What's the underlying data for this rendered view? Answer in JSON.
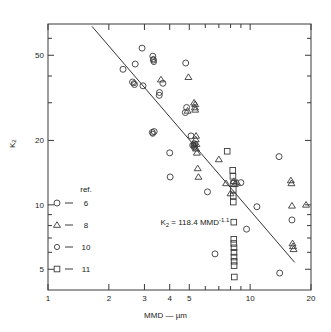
{
  "chart_data": {
    "type": "scatter",
    "title": "",
    "xlabel": "MMD — µm",
    "ylabel": "K₂",
    "xscale": "log",
    "yscale": "log",
    "xlim": [
      1,
      20
    ],
    "ylim": [
      4,
      70
    ],
    "grid": false,
    "x_ticks_labeled": [
      1,
      2,
      3,
      4,
      5,
      10,
      20
    ],
    "x_tick_labels": [
      "1",
      "2",
      "3",
      "4",
      "5",
      "10",
      "20"
    ],
    "y_ticks_labeled": [
      5,
      10,
      20,
      50
    ],
    "y_tick_labels": [
      "5",
      "10",
      "20",
      "50"
    ],
    "x_minor_ticks": [
      6,
      7,
      8,
      9
    ],
    "y_minor_ticks": [
      6,
      7,
      8,
      9,
      30,
      40,
      60
    ],
    "annotation": {
      "text": "K₂ = 118.4 MMD⁻¹·¹",
      "x": 3.6,
      "y": 8.3,
      "base": "K",
      "sub": "2",
      "eq": " = 118.4 MMD",
      "exp": "-1.1"
    },
    "fit_line": {
      "label": "K2 = 118.4 MMD^-1.1",
      "coefficient": 118.4,
      "exponent": -1.1,
      "x_start": 1.65,
      "x_end": 16.6
    },
    "legend": {
      "header": "ref.",
      "position": "lower-left",
      "entries": [
        {
          "marker": "circle",
          "size": 6.0,
          "label": "6"
        },
        {
          "marker": "triangle",
          "size": 6.0,
          "label": "8"
        },
        {
          "marker": "circle",
          "size": 5.2,
          "label": "10"
        },
        {
          "marker": "square",
          "size": 5.6,
          "label": "11"
        }
      ]
    },
    "series": [
      {
        "name": "6",
        "marker": "circle",
        "points": [
          [
            2.35,
            43.0
          ],
          [
            2.62,
            37.5
          ],
          [
            2.68,
            36.5
          ],
          [
            2.7,
            45.5
          ],
          [
            2.95,
            36.0
          ],
          [
            2.92,
            54.0
          ],
          [
            3.3,
            49.5
          ],
          [
            3.32,
            47.5
          ],
          [
            3.28,
            21.8
          ],
          [
            3.35,
            22.0
          ],
          [
            3.55,
            32.5
          ],
          [
            3.56,
            33.5
          ],
          [
            3.7,
            37.0
          ],
          [
            4.0,
            17.5
          ],
          [
            4.02,
            13.5
          ],
          [
            4.8,
            46.0
          ],
          [
            4.85,
            28.5
          ],
          [
            4.78,
            27.0
          ],
          [
            5.2,
            19.0
          ],
          [
            5.3,
            19.3
          ],
          [
            5.32,
            18.8
          ],
          [
            6.15,
            11.5
          ],
          [
            6.7,
            5.9
          ],
          [
            9.6,
            7.7
          ],
          [
            9.0,
            12.7
          ],
          [
            10.8,
            9.8
          ],
          [
            13.9,
            16.8
          ],
          [
            14.0,
            4.8
          ],
          [
            16.1,
            8.5
          ],
          [
            5.1,
            21.0
          ]
        ]
      },
      {
        "name": "8",
        "marker": "triangle",
        "points": [
          [
            3.62,
            38.5
          ],
          [
            4.95,
            39.5
          ],
          [
            4.9,
            27.5
          ],
          [
            5.35,
            29.5
          ],
          [
            5.33,
            28.5
          ],
          [
            5.35,
            27.8
          ],
          [
            5.4,
            21.0
          ],
          [
            5.38,
            20.2
          ],
          [
            5.42,
            19.2
          ],
          [
            5.4,
            18.3
          ],
          [
            5.45,
            17.5
          ],
          [
            5.5,
            14.8
          ],
          [
            5.55,
            13.5
          ],
          [
            7.0,
            16.3
          ],
          [
            7.6,
            12.6
          ],
          [
            8.0,
            11.3
          ],
          [
            8.3,
            12.9
          ],
          [
            8.4,
            12.5
          ],
          [
            8.6,
            12.7
          ],
          [
            15.9,
            13.0
          ],
          [
            16.0,
            12.6
          ],
          [
            16.1,
            9.9
          ],
          [
            16.2,
            6.6
          ],
          [
            16.3,
            6.4
          ],
          [
            16.4,
            6.2
          ],
          [
            18.9,
            10.0
          ],
          [
            5.28,
            30.0
          ]
        ]
      },
      {
        "name": "10",
        "marker": "circle",
        "points": [
          [
            3.32,
            48.0
          ],
          [
            3.34,
            46.5
          ],
          [
            2.66,
            37.0
          ],
          [
            5.25,
            19.0
          ],
          [
            5.28,
            18.5
          ],
          [
            3.3,
            21.5
          ]
        ]
      },
      {
        "name": "11",
        "marker": "square",
        "points": [
          [
            7.7,
            17.8
          ],
          [
            8.2,
            14.5
          ],
          [
            8.22,
            13.6
          ],
          [
            8.25,
            11.8
          ],
          [
            8.25,
            11.0
          ],
          [
            8.25,
            10.3
          ],
          [
            8.3,
            8.3
          ],
          [
            8.3,
            6.9
          ],
          [
            8.3,
            6.6
          ],
          [
            8.32,
            6.3
          ],
          [
            8.32,
            6.0
          ],
          [
            8.32,
            5.7
          ],
          [
            8.33,
            5.45
          ],
          [
            8.33,
            5.2
          ],
          [
            8.35,
            4.6
          ],
          [
            8.28,
            12.6
          ]
        ]
      }
    ]
  },
  "axis": {
    "x_title": "MMD — µm",
    "y_title": "K",
    "y_title_sub": "2"
  }
}
